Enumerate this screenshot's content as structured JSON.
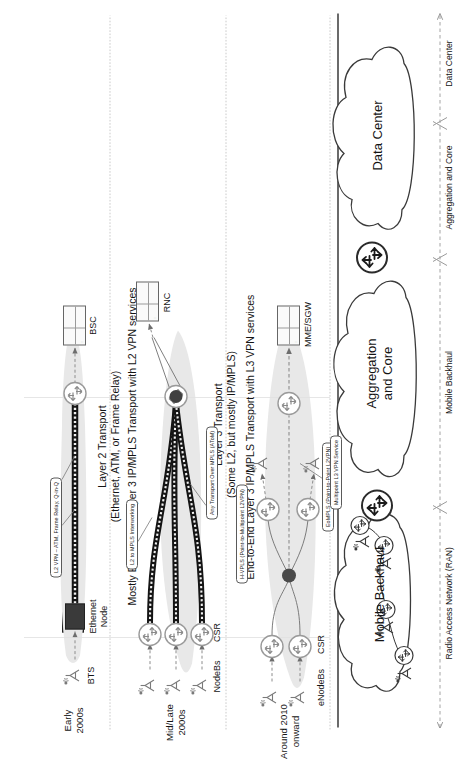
{
  "figure": {
    "type": "network-architecture-diagram",
    "orientation": "rotated-90-ccw"
  },
  "eras": [
    {
      "id": "early2000s",
      "line1": "Early",
      "line2": "2000s"
    },
    {
      "id": "midlate2000s",
      "line1": "Mid/Late",
      "line2": "2000s"
    },
    {
      "id": "around2010",
      "line1": "Around 2010",
      "line2": "onward"
    }
  ],
  "rows": [
    {
      "id": "row-early2000s",
      "era": "Early 2000s",
      "access_device": "BTS",
      "aggregation_device": "Ethernet\nNode",
      "aggregation_device_line1": "Ethernet",
      "aggregation_device_line2": "Node",
      "core_device": "BSC",
      "transport_line1": "Layer 2 Transport",
      "transport_line2": "(Ethernet, ATM, or Frame Relay)",
      "callouts": [
        "L2 VPN – ATM, Frame Relay, Q-in-Q"
      ]
    },
    {
      "id": "row-midlate2000s",
      "era": "Mid/Late 2000s",
      "access_device": "NodeBs",
      "aggregation_device": "CSR",
      "core_device": "RNC",
      "transport_line1": "Layer 3 Transport",
      "transport_line2": "(Some L2, but mostly IP/MPLS)",
      "callouts": [
        "L2 to MPLS Interworking",
        "Any Transport Over MPLS (AToM)"
      ]
    },
    {
      "id": "row-around2010",
      "era": "Around 2010 onward",
      "access_device": "eNodeBs",
      "aggregation_device": "CSR",
      "core_device": "MME/SGW",
      "callouts": [
        "H-VPLS (Point-to-Multipoint L2VPN)",
        "EoMPLS (Point-to-Point L2VPN)",
        "Multipoint L3 VPN Service"
      ]
    }
  ],
  "device_labels": {
    "bts": "BTS",
    "ethernet_node_l1": "Ethernet",
    "ethernet_node_l2": "Node",
    "bsc": "BSC",
    "nodebs": "NodeBs",
    "csr_mid": "CSR",
    "rnc": "RNC",
    "enodebs": "eNodeBs",
    "csr_new": "CSR",
    "mme_sgw": "MME/SGW"
  },
  "transport_bands": [
    {
      "id": "band-l2",
      "line1": "Layer 2 Transport",
      "line2": "(Ethernet, ATM, or Frame Relay)"
    },
    {
      "id": "band-l3-partial",
      "line1": "Layer 3 Transport",
      "line2": "(Some L2, but mostly IP/MPLS)"
    },
    {
      "id": "band-l2vpn",
      "line1": "Mostly End-to-End Layer 3 IP/MPLS Transport with L2 VPN services",
      "line2": ""
    },
    {
      "id": "band-l3vpn",
      "line1": "End-to-End Layer 3 IP/MPLS Transport with L3 VPN services",
      "line2": ""
    }
  ],
  "callouts": [
    {
      "id": "callout-l2vpn-atm",
      "text": "L2 VPN – ATM, Frame Relay, Q-in-Q"
    },
    {
      "id": "callout-l2-mpls-iw",
      "text": "L2 to MPLS Interworking"
    },
    {
      "id": "callout-atom",
      "text": "Any Transport Over MPLS (AToM)"
    },
    {
      "id": "callout-hvpls",
      "text": "H-VPLS (Point-to-Multipoint L2VPN)"
    },
    {
      "id": "callout-eompls",
      "text": "EoMPLS (Point-to-Point L2VPN)"
    },
    {
      "id": "callout-l3vpn",
      "text": "Multipoint L3 VPN Service"
    }
  ],
  "reference_clouds": [
    {
      "id": "cloud-mobile-backhaul",
      "label": "Mobile Backhaul"
    },
    {
      "id": "cloud-aggregation-core",
      "line1": "Aggregation",
      "line2": "and Core"
    },
    {
      "id": "cloud-data-center",
      "label": "Data Center"
    }
  ],
  "zones": [
    {
      "id": "zone-ran",
      "line1": "Radio Access",
      "line2": "Network (RAN)"
    },
    {
      "id": "zone-backhaul",
      "line1": "Mobile Backhaul",
      "line2": ""
    },
    {
      "id": "zone-agg-core",
      "line1": "Aggregation and Core",
      "line2": ""
    },
    {
      "id": "zone-dc",
      "line1": "Data Center",
      "line2": ""
    }
  ],
  "colors": {
    "ink": "#1a1a1a",
    "stroke": "#5a5a5a",
    "shadow_fill": "#e6e6e6",
    "pipe_dark": "#141414",
    "node_dark": "#3a3a3a",
    "grid": "#cccccc"
  }
}
